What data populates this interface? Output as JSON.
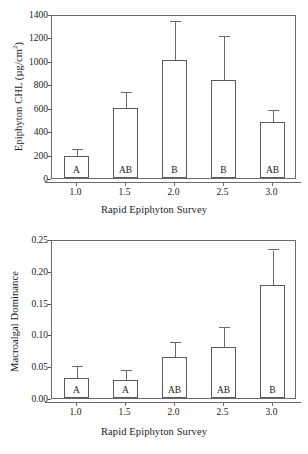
{
  "figure": {
    "panels": [
      "top",
      "bottom"
    ]
  },
  "chart_data": [
    {
      "type": "bar",
      "panel": "top",
      "title": "",
      "xlabel": "Rapid Epiphyton Survey",
      "ylabel": "Epiphyton CHL (µg/cm",
      "ylabel_sup": "2",
      "ylabel_suffix": ")",
      "categories": [
        "1.0",
        "1.5",
        "2.0",
        "2.5",
        "3.0"
      ],
      "values": [
        190,
        595,
        1010,
        835,
        475
      ],
      "error_upper": [
        240,
        725,
        1335,
        1205,
        570
      ],
      "group_labels": [
        "A",
        "AB",
        "B",
        "B",
        "AB"
      ],
      "ylim": [
        0,
        1400
      ],
      "yticks": [
        0,
        200,
        400,
        600,
        800,
        1000,
        1200,
        1400
      ],
      "ytick_labels": [
        "0",
        "200",
        "400",
        "600",
        "800",
        "1000",
        "1200",
        "1400"
      ],
      "grid": false,
      "legend": "none"
    },
    {
      "type": "bar",
      "panel": "bottom",
      "title": "",
      "xlabel": "Rapid Epiphyton Survey",
      "ylabel": "Macroalgal Dominance",
      "ylabel_sup": "",
      "ylabel_suffix": "",
      "categories": [
        "1.0",
        "1.5",
        "2.0",
        "2.5",
        "3.0"
      ],
      "values": [
        0.031,
        0.029,
        0.064,
        0.08,
        0.178
      ],
      "error_upper": [
        0.048,
        0.043,
        0.087,
        0.11,
        0.232
      ],
      "group_labels": [
        "A",
        "A",
        "AB",
        "AB",
        "B"
      ],
      "ylim": [
        0,
        0.25
      ],
      "yticks": [
        0.0,
        0.05,
        0.1,
        0.15,
        0.2,
        0.25
      ],
      "ytick_labels": [
        "0.00",
        "0.05",
        "0.10",
        "0.15",
        "0.20",
        "0.25"
      ],
      "grid": false,
      "legend": "none"
    }
  ]
}
